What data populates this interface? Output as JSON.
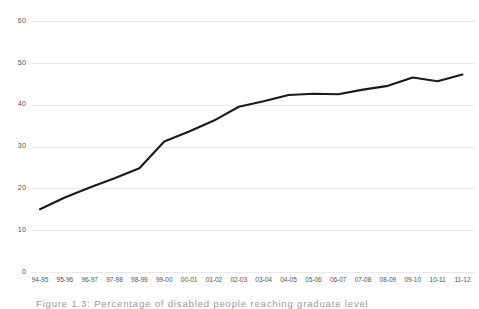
{
  "figure": {
    "caption": "Figure 1.3: Percentage of disabled people reaching graduate level"
  },
  "chart_data": {
    "type": "line",
    "title": "",
    "subtitle": "",
    "xlabel": "",
    "ylabel": "",
    "grid": true,
    "legend": "none",
    "line_color": "#1a1a1a",
    "gridline_color": "#e9e9e9",
    "ylim": [
      0,
      60
    ],
    "yticks": [
      0,
      10,
      20,
      30,
      40,
      50,
      60
    ],
    "ytick_labels": [
      "0",
      "10",
      "20",
      "30",
      "40",
      "50",
      "60"
    ],
    "categories": [
      "94-95",
      "95-96",
      "96-97",
      "97-98",
      "98-99",
      "99-00",
      "00-01",
      "01-02",
      "02-03",
      "03-04",
      "04-05",
      "05-06",
      "06-07",
      "07-08",
      "08-09",
      "09-10",
      "10-11",
      "11-12"
    ],
    "series": [
      {
        "name": "percentage",
        "values": [
          15.0,
          17.8,
          20.2,
          22.4,
          24.8,
          31.2,
          33.6,
          36.2,
          39.5,
          40.8,
          42.3,
          42.6,
          42.5,
          43.6,
          44.5,
          46.5,
          45.6,
          47.2
        ]
      }
    ]
  }
}
